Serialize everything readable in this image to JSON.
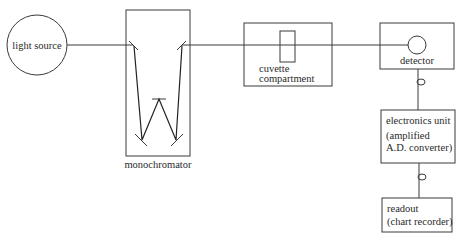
{
  "diagram": {
    "type": "spectrophotometer block diagram",
    "nodes": {
      "light_source": {
        "label": "light source"
      },
      "monochromator": {
        "label": "monochromator"
      },
      "cuvette": {
        "label_line1": "cuvette",
        "label_line2": "compartment"
      },
      "detector": {
        "label": "detector"
      },
      "electronics": {
        "label_line1": "electronics unit",
        "label_line2": "(amplified",
        "label_line3": "A.D. converter)"
      },
      "readout": {
        "label_line1": "readout",
        "label_line2": "(chart recorder)"
      }
    },
    "edges": [
      {
        "from": "light source",
        "to": "monochromator",
        "kind": "light path"
      },
      {
        "from": "monochromator",
        "to": "cuvette compartment",
        "kind": "light path"
      },
      {
        "from": "cuvette compartment",
        "to": "detector",
        "kind": "light path"
      },
      {
        "from": "detector",
        "to": "electronics unit",
        "kind": "electrical connection"
      },
      {
        "from": "electronics unit",
        "to": "readout",
        "kind": "electrical connection"
      }
    ],
    "colors": {
      "line": "#3a3a3a",
      "background": "#ffffff"
    }
  }
}
